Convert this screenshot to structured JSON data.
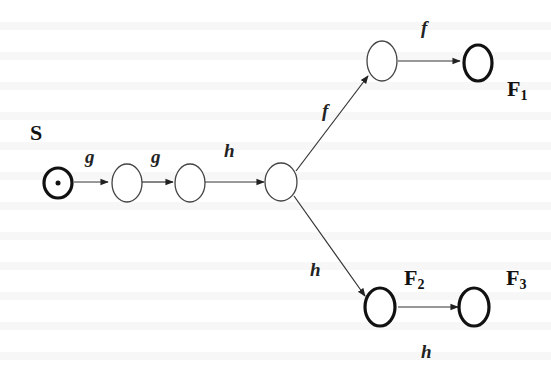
{
  "diagram": {
    "type": "state-transition",
    "colors": {
      "stroke": "#333333",
      "final_stroke": "#111111",
      "background": "#ffffff"
    },
    "labels": {
      "start": "S",
      "f1_main": "F",
      "f1_sub": "1",
      "f2_main": "F",
      "f2_sub": "2",
      "f3_main": "F",
      "f3_sub": "3"
    },
    "nodes": [
      {
        "id": "S",
        "kind": "start"
      },
      {
        "id": "n1",
        "kind": "intermediate"
      },
      {
        "id": "n2",
        "kind": "intermediate"
      },
      {
        "id": "n3",
        "kind": "branch"
      },
      {
        "id": "n4",
        "kind": "intermediate"
      },
      {
        "id": "F1",
        "kind": "final"
      },
      {
        "id": "F2",
        "kind": "final"
      },
      {
        "id": "F3",
        "kind": "final"
      }
    ],
    "edges": [
      {
        "from": "S",
        "to": "n1",
        "label": "g"
      },
      {
        "from": "n1",
        "to": "n2",
        "label": "g"
      },
      {
        "from": "n2",
        "to": "n3",
        "label": "h"
      },
      {
        "from": "n3",
        "to": "n4",
        "label": "f"
      },
      {
        "from": "n4",
        "to": "F1",
        "label": "f"
      },
      {
        "from": "n3",
        "to": "F2",
        "label": "h"
      },
      {
        "from": "F2",
        "to": "F3",
        "label": "h"
      }
    ]
  }
}
